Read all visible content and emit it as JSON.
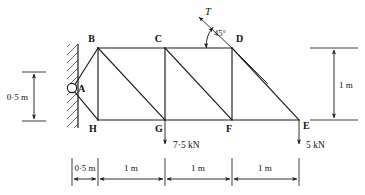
{
  "figure": {
    "nodes": [
      {
        "id": "A",
        "label": "A",
        "x": 72,
        "y": 88,
        "label_dx": 6,
        "label_dy": 4
      },
      {
        "id": "B",
        "label": "B",
        "x": 98,
        "y": 48,
        "label_dx": -9,
        "label_dy": -4
      },
      {
        "id": "C",
        "label": "C",
        "x": 165,
        "y": 48,
        "label_dx": -9,
        "label_dy": -4
      },
      {
        "id": "D",
        "label": "D",
        "x": 232,
        "y": 48,
        "label_dx": 4,
        "label_dy": -4
      },
      {
        "id": "E",
        "label": "E",
        "x": 299,
        "y": 120,
        "label_dx": 4,
        "label_dy": 9
      },
      {
        "id": "F",
        "label": "F",
        "x": 232,
        "y": 120,
        "label_dx": -3,
        "label_dy": 11
      },
      {
        "id": "G",
        "label": "G",
        "x": 165,
        "y": 120,
        "label_dx": -9,
        "label_dy": 11
      },
      {
        "id": "H",
        "label": "H",
        "x": 98,
        "y": 120,
        "label_dx": -9,
        "label_dy": 11
      }
    ],
    "members": [
      {
        "name": "member-A-B",
        "from": "A",
        "to": "B"
      },
      {
        "name": "member-A-H",
        "from": "A",
        "to": "H"
      },
      {
        "name": "member-B-H",
        "from": "B",
        "to": "H"
      },
      {
        "name": "member-B-C",
        "from": "B",
        "to": "C"
      },
      {
        "name": "member-C-D",
        "from": "C",
        "to": "D"
      },
      {
        "name": "member-B-G",
        "from": "B",
        "to": "G"
      },
      {
        "name": "member-C-G",
        "from": "C",
        "to": "G"
      },
      {
        "name": "member-C-F",
        "from": "C",
        "to": "F"
      },
      {
        "name": "member-D-F",
        "from": "D",
        "to": "F"
      },
      {
        "name": "member-D-E",
        "from": "D",
        "to": "E"
      },
      {
        "name": "member-H-G",
        "from": "H",
        "to": "G"
      },
      {
        "name": "member-G-F",
        "from": "G",
        "to": "F"
      },
      {
        "name": "member-F-E",
        "from": "F",
        "to": "E"
      }
    ],
    "support": {
      "name": "pin-support-A",
      "type": "pin",
      "x": 72,
      "y": 88,
      "radius": 4.6,
      "wall_x": 78,
      "wall_top": 44,
      "wall_bottom": 128,
      "wall_thickness": 11
    },
    "forces": [
      {
        "name": "tension-force-T",
        "label": "T",
        "at_node": "D",
        "tip_x": 197,
        "tip_y": 15,
        "label_x": 205,
        "label_y": 14,
        "direction": "up-left-45deg"
      },
      {
        "name": "point-load-G",
        "label": "7·5 kN",
        "at_node": "G",
        "magnitude": "7·5 kN",
        "x": 165,
        "y_start": 120,
        "y_end": 146,
        "label_x": 173,
        "label_y": 147,
        "direction": "down"
      },
      {
        "name": "point-load-E",
        "label": "5 kN",
        "at_node": "E",
        "magnitude": "5 kN",
        "x": 299,
        "y_start": 120,
        "y_end": 146,
        "label_x": 307,
        "label_y": 147,
        "direction": "down"
      }
    ],
    "angle_annotation": {
      "name": "angle-45-degrees",
      "label": "45°",
      "value": "45°",
      "label_x": 217,
      "label_y": 35,
      "vertex_x": 232,
      "vertex_y": 48
    },
    "dimensions_vertical": [
      {
        "name": "dimension-left-0-5m",
        "label": "0·5 m",
        "value": "0·5 m",
        "axis_x": 34,
        "top_y": 72,
        "bottom_y": 121,
        "label_x": 4,
        "label_y": 100,
        "ext_top": {
          "x1": 22,
          "x2": 46,
          "y": 72
        },
        "ext_bottom": {
          "x1": 22,
          "x2": 46,
          "y": 121
        }
      },
      {
        "name": "dimension-right-1m",
        "label": "1 m",
        "value": "1 m",
        "axis_x": 334,
        "top_y": 48,
        "bottom_y": 120,
        "label_x": 339,
        "label_y": 87,
        "ext_top": {
          "x1": 312,
          "x2": 358,
          "y": 48
        },
        "ext_bottom": {
          "x1": 312,
          "x2": 358,
          "y": 120
        }
      }
    ],
    "dimension_chain": {
      "name": "dimension-chain-horizontal",
      "baseline_y": 179,
      "tick_top": 158,
      "tick_bottom": 185,
      "label_y": 169,
      "segments": [
        {
          "name": "dimension-segment-0-5m",
          "label": "0·5 m",
          "value": "0·5 m",
          "x_start": 72,
          "x_end": 98
        },
        {
          "name": "dimension-segment-1m-1",
          "label": "1 m",
          "value": "1 m",
          "x_start": 98,
          "x_end": 165
        },
        {
          "name": "dimension-segment-1m-2",
          "label": "1 m",
          "value": "1 m",
          "x_start": 165,
          "x_end": 232
        },
        {
          "name": "dimension-segment-1m-3",
          "label": "1 m",
          "value": "1 m",
          "x_start": 232,
          "x_end": 299
        }
      ]
    },
    "colors": {
      "line": "#1a1a1a",
      "hatch": "#3a3a3a",
      "background": "#ffffff",
      "text": "#111111"
    }
  }
}
